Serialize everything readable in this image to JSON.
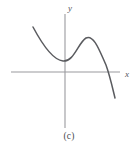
{
  "figure": {
    "caption": "(c)",
    "background_color": "#ffffff",
    "axis_color": "#9a9a9e",
    "curve_color": "#5a5b5f"
  },
  "axes": {
    "x_label": "x",
    "y_label": "y",
    "x_axis": {
      "x1": 11,
      "y1": 72,
      "x2": 120,
      "y2": 72
    },
    "y_axis": {
      "x1": 65,
      "y1": 14,
      "x2": 65,
      "y2": 128
    },
    "x_label_pos": {
      "x": 125,
      "y": 74
    },
    "y_label_pos": {
      "x": 68,
      "y": 11
    }
  },
  "chart_data": {
    "type": "line",
    "title": "",
    "xlabel": "x",
    "ylabel": "y",
    "grid": false,
    "legend": null,
    "x": [
      33,
      40,
      48,
      56,
      63,
      70,
      77,
      85,
      92,
      99,
      105,
      110,
      115
    ],
    "y": [
      27,
      38,
      50,
      58,
      62,
      58,
      47,
      38,
      38,
      46,
      60,
      74,
      98
    ],
    "features": {
      "local_minimum": {
        "x": 63,
        "y": 62
      },
      "local_maximum": {
        "x": 86,
        "y": 38
      },
      "x_intercept": {
        "x": 108,
        "y": 72
      },
      "start_point": {
        "x": 33,
        "y": 27
      },
      "end_point": {
        "x": 115,
        "y": 98
      }
    },
    "path": "M 33 27 C 41 42, 52 60, 63 61 C 74 62, 78 43, 86 38 C 94 34, 100 52, 106 65 C 110 76, 113 90, 115 98",
    "ylim": [
      0,
      132
    ],
    "xlim": [
      0,
      138
    ]
  }
}
